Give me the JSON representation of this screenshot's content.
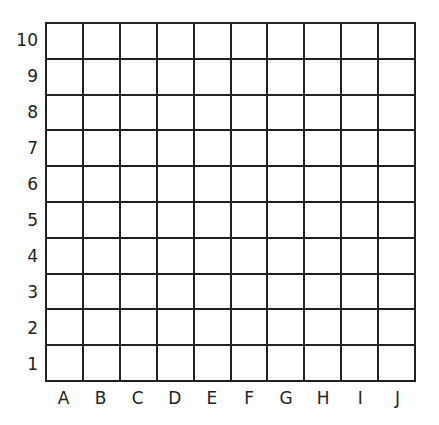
{
  "grid": {
    "rows": 10,
    "cols": 10,
    "row_labels": [
      "10",
      "9",
      "8",
      "7",
      "6",
      "5",
      "4",
      "3",
      "2",
      "1"
    ],
    "col_labels": [
      "A",
      "B",
      "C",
      "D",
      "E",
      "F",
      "G",
      "H",
      "I",
      "J"
    ],
    "line_color": "#222222",
    "background": "#ffffff"
  }
}
